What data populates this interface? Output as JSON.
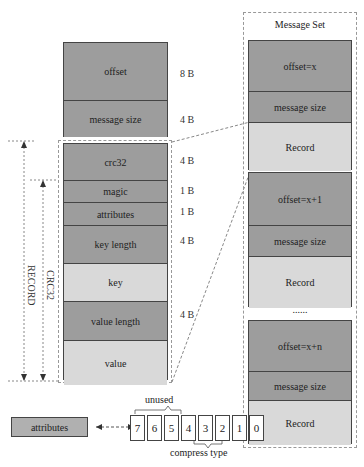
{
  "message_header": {
    "fields": [
      {
        "label": "offset",
        "size": "8 B"
      },
      {
        "label": "message size",
        "size": "4 B"
      }
    ]
  },
  "record": {
    "fields": [
      {
        "label": "crc32",
        "size": "4 B"
      },
      {
        "label": "magic",
        "size": "1 B"
      },
      {
        "label": "attributes",
        "size": "1 B"
      },
      {
        "label": "key length",
        "size": "4 B"
      },
      {
        "label": "key",
        "size": ""
      },
      {
        "label": "value length",
        "size": "4 B"
      },
      {
        "label": "value",
        "size": ""
      }
    ],
    "brackets": {
      "record": "RECORD",
      "crc": "CRC32"
    }
  },
  "message_set": {
    "title": "Message Set",
    "groups": [
      {
        "offset": "offset=x",
        "size": "message size",
        "record": "Record"
      },
      {
        "offset": "offset=x+1",
        "size": "message size",
        "record": "Record"
      },
      {
        "offset": "offset=x+n",
        "size": "message size",
        "record": "Record"
      }
    ],
    "ellipsis": "......"
  },
  "attributes_detail": {
    "label": "attributes",
    "bits": [
      "7",
      "6",
      "5",
      "4",
      "3",
      "2",
      "1",
      "0"
    ],
    "unused_label": "unused",
    "compress_label": "compress type"
  }
}
